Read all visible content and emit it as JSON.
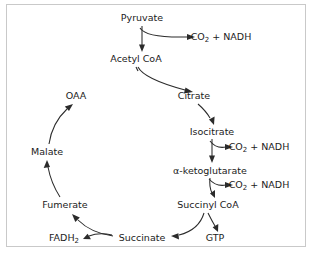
{
  "diagram": {
    "background_color": "#ffffff",
    "border_color": "#c9c9c9",
    "line_color": "#2b2b2b",
    "text_color": "#1b1b1b",
    "nodes": {
      "pyruvate": {
        "label": "Pyruvate",
        "x": 135,
        "y": 13
      },
      "co2_nadh_1": {
        "label_main": "CO",
        "label_sub": "2",
        "label_tail": " + NADH",
        "x": 214,
        "y": 32
      },
      "acetyl_coa": {
        "label": "Acetyl CoA",
        "x": 129,
        "y": 54
      },
      "oaa": {
        "label": "OAA",
        "x": 69,
        "y": 91
      },
      "citrate": {
        "label": "Citrate",
        "x": 187,
        "y": 91
      },
      "isocitrate": {
        "label": "Isocitrate",
        "x": 205,
        "y": 127
      },
      "co2_nadh_2": {
        "label_main": "CO",
        "label_sub": "2",
        "label_tail": " + NADH",
        "x": 252,
        "y": 142
      },
      "alpha_ketoglutarate": {
        "label_main": "α-ketoglutarate",
        "x": 203,
        "y": 166
      },
      "co2_nadh_3": {
        "label_main": "CO",
        "label_sub": "2",
        "label_tail": " + NADH",
        "x": 252,
        "y": 180
      },
      "succinyl_coa": {
        "label": "Succinyl CoA",
        "x": 201,
        "y": 200
      },
      "gtp": {
        "label": "GTP",
        "x": 208,
        "y": 233
      },
      "succinate": {
        "label": "Succinate",
        "x": 135,
        "y": 233
      },
      "fumerate": {
        "label": "Fumerate",
        "x": 58,
        "y": 200
      },
      "fadh2": {
        "label_main": "FADH",
        "label_sub": "2",
        "x": 57,
        "y": 233
      },
      "malate": {
        "label": "Malate",
        "x": 40,
        "y": 147
      }
    },
    "edges": [
      {
        "name": "pyruvate-to-acetyl-coa",
        "from": "pyruvate",
        "to": "acetyl_coa"
      },
      {
        "name": "pyruvate-branch-to-co2-nadh",
        "from": "pyruvate",
        "to": "co2_nadh_1"
      },
      {
        "name": "acetyl-coa-to-citrate",
        "from": "acetyl_coa",
        "to": "citrate"
      },
      {
        "name": "citrate-to-isocitrate",
        "from": "citrate",
        "to": "isocitrate"
      },
      {
        "name": "isocitrate-to-alpha-ketoglutarate",
        "from": "isocitrate",
        "to": "alpha_ketoglutarate"
      },
      {
        "name": "isocitrate-branch-to-co2-nadh",
        "from": "isocitrate",
        "to": "co2_nadh_2"
      },
      {
        "name": "alpha-ketoglutarate-to-succinyl-coa",
        "from": "alpha_ketoglutarate",
        "to": "succinyl_coa"
      },
      {
        "name": "alpha-ketoglutarate-branch-to-co2-nadh",
        "from": "alpha_ketoglutarate",
        "to": "co2_nadh_3"
      },
      {
        "name": "succinyl-coa-to-succinate",
        "from": "succinyl_coa",
        "to": "succinate"
      },
      {
        "name": "succinyl-coa-branch-to-gtp",
        "from": "succinyl_coa",
        "to": "gtp"
      },
      {
        "name": "succinate-to-fumerate",
        "from": "succinate",
        "to": "fumerate"
      },
      {
        "name": "succinate-branch-to-fadh2",
        "from": "succinate",
        "to": "fadh2"
      },
      {
        "name": "fumerate-to-malate",
        "from": "fumerate",
        "to": "malate"
      },
      {
        "name": "malate-to-oaa",
        "from": "malate",
        "to": "oaa"
      }
    ]
  }
}
